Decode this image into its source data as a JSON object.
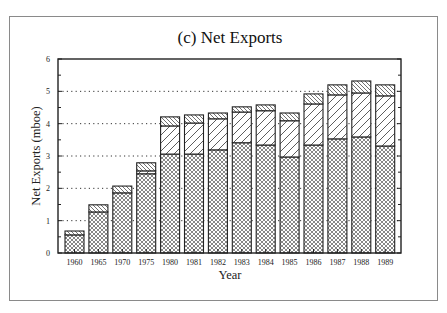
{
  "chart_data": {
    "type": "bar",
    "stacked": true,
    "title": "(c) Net Exports",
    "xlabel": "Year",
    "ylabel": "Net Exports (mboe)",
    "ylim": [
      0,
      6
    ],
    "yticks": [
      0,
      1,
      2,
      3,
      4,
      5,
      6
    ],
    "grid": "dotted horizontal at 1-5",
    "legend": "none",
    "categories": [
      "1960",
      "1965",
      "1970",
      "1975",
      "1980",
      "1981",
      "1982",
      "1983",
      "1984",
      "1985",
      "1986",
      "1987",
      "1988",
      "1989"
    ],
    "series": [
      {
        "name": "bottom (cross-hatched)",
        "pattern": "crosshatch",
        "values": [
          0.56,
          1.27,
          1.86,
          2.45,
          3.06,
          3.06,
          3.19,
          3.41,
          3.34,
          2.97,
          3.34,
          3.53,
          3.59,
          3.31
        ]
      },
      {
        "name": "middle (forward diagonal)",
        "pattern": "diag-forward",
        "values": [
          0.0,
          0.0,
          0.0,
          0.09,
          0.87,
          0.96,
          0.96,
          0.95,
          1.06,
          1.12,
          1.27,
          1.36,
          1.36,
          1.55
        ]
      },
      {
        "name": "top (back diagonal)",
        "pattern": "diag-back",
        "values": [
          0.12,
          0.22,
          0.21,
          0.25,
          0.28,
          0.25,
          0.18,
          0.16,
          0.18,
          0.24,
          0.31,
          0.31,
          0.37,
          0.34
        ]
      }
    ],
    "totals": [
      0.68,
      1.49,
      2.07,
      2.79,
      4.21,
      4.27,
      4.33,
      4.52,
      4.58,
      4.33,
      4.92,
      5.2,
      5.32,
      5.2
    ]
  }
}
